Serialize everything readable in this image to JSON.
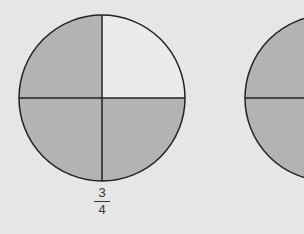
{
  "diagram": {
    "circles": [
      {
        "id": 1,
        "parts": 4,
        "shaded_parts": 3,
        "unshaded": "top-right",
        "label": {
          "numerator": "3",
          "denominator": "4"
        }
      },
      {
        "id": 2,
        "parts": 4,
        "partially_visible": true
      }
    ],
    "colors": {
      "shaded": "#b3b3b3",
      "unshaded": "#ebebeb",
      "stroke": "#222222",
      "background": "#e6e6e6"
    }
  }
}
